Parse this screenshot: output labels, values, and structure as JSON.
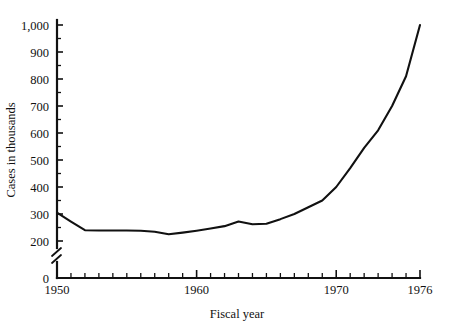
{
  "chart_data": {
    "type": "line",
    "title": "",
    "xlabel": "Fiscal year",
    "ylabel": "Cases in thousands",
    "xlim": [
      1950,
      1976
    ],
    "ylim": [
      200,
      1000
    ],
    "y_axis_break": true,
    "y_break_between": [
      0,
      200
    ],
    "grid": false,
    "legend": null,
    "y_tick_labels": [
      "0",
      "200",
      "300",
      "400",
      "500",
      "600",
      "700",
      "800",
      "900",
      "1,000"
    ],
    "y_tick_values": [
      0,
      200,
      300,
      400,
      500,
      600,
      700,
      800,
      900,
      1000
    ],
    "y_minor_step": 50,
    "x_tick_labels": [
      "1950",
      "1960",
      "1970",
      "1976"
    ],
    "x_tick_values": [
      1950,
      1960,
      1970,
      1976
    ],
    "x_minor_step": 1,
    "line_color": "#111111",
    "x": [
      1950,
      1951,
      1952,
      1953,
      1954,
      1955,
      1956,
      1957,
      1958,
      1959,
      1960,
      1961,
      1962,
      1963,
      1964,
      1965,
      1966,
      1967,
      1968,
      1969,
      1970,
      1971,
      1972,
      1973,
      1974,
      1975,
      1976
    ],
    "values": [
      305,
      272,
      240,
      239,
      239,
      239,
      238,
      234,
      225,
      231,
      238,
      246,
      255,
      272,
      262,
      264,
      281,
      300,
      325,
      350,
      400,
      470,
      545,
      610,
      700,
      810,
      1000
    ],
    "series": [
      {
        "name": "Cases in thousands",
        "values": [
          305,
          272,
          240,
          239,
          239,
          239,
          238,
          234,
          225,
          231,
          238,
          246,
          255,
          272,
          262,
          264,
          281,
          300,
          325,
          350,
          400,
          470,
          545,
          610,
          700,
          810,
          1000
        ]
      }
    ]
  }
}
